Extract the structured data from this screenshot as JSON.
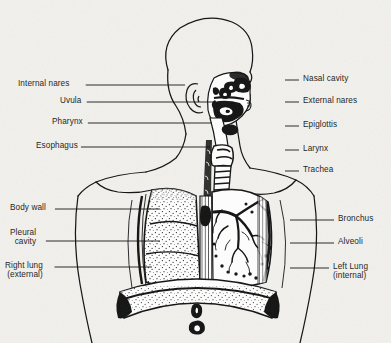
{
  "figure": {
    "style": "black-and-white scanned line drawing",
    "background_color": "#f2f1ed",
    "ink_color": "#111111"
  },
  "labels": {
    "left": [
      {
        "id": "internal-nares",
        "text": "Internal nares",
        "x": 18,
        "y": 79,
        "line_to_x": 185,
        "line_y": 85
      },
      {
        "id": "uvula",
        "text": "Uvula",
        "x": 60,
        "y": 96,
        "line_to_x": 214,
        "line_y": 102
      },
      {
        "id": "pharynx",
        "text": "Pharynx",
        "x": 52,
        "y": 117,
        "line_to_x": 212,
        "line_y": 123
      },
      {
        "id": "esophagus",
        "text": "Esophagus",
        "x": 36,
        "y": 141,
        "line_to_x": 210,
        "line_y": 147
      },
      {
        "id": "body-wall",
        "text": "Body wall",
        "x": 10,
        "y": 203,
        "line_to_x": 160,
        "line_y": 209
      },
      {
        "id": "pleural-cavity",
        "text": "Pleural\ncavity",
        "x": 10,
        "y": 228,
        "line_to_x": 160,
        "line_y": 241
      },
      {
        "id": "right-lung",
        "text": "Right lung\n(external)",
        "x": 5,
        "y": 261,
        "line_to_x": 152,
        "line_y": 267
      }
    ],
    "right": [
      {
        "id": "nasal-cavity",
        "text": "Nasal cavity",
        "x": 303,
        "y": 74,
        "line_from_x": 285,
        "line_y": 80
      },
      {
        "id": "external-nares",
        "text": "External nares",
        "x": 303,
        "y": 96,
        "line_from_x": 285,
        "line_y": 102
      },
      {
        "id": "epiglottis",
        "text": "Epiglottis",
        "x": 303,
        "y": 120,
        "line_from_x": 285,
        "line_y": 126
      },
      {
        "id": "larynx",
        "text": "Larynx",
        "x": 303,
        "y": 144,
        "line_from_x": 285,
        "line_y": 150
      },
      {
        "id": "trachea",
        "text": "Trachea",
        "x": 303,
        "y": 165,
        "line_from_x": 285,
        "line_y": 171
      },
      {
        "id": "bronchus",
        "text": "Bronchus",
        "x": 338,
        "y": 214,
        "line_from_x": 290,
        "line_y": 220
      },
      {
        "id": "alveoli",
        "text": "Alveoli",
        "x": 338,
        "y": 237,
        "line_from_x": 290,
        "line_y": 243
      },
      {
        "id": "left-lung",
        "text": "Left Lung\n(internal)",
        "x": 333,
        "y": 262,
        "line_from_x": 290,
        "line_y": 268
      }
    ]
  }
}
